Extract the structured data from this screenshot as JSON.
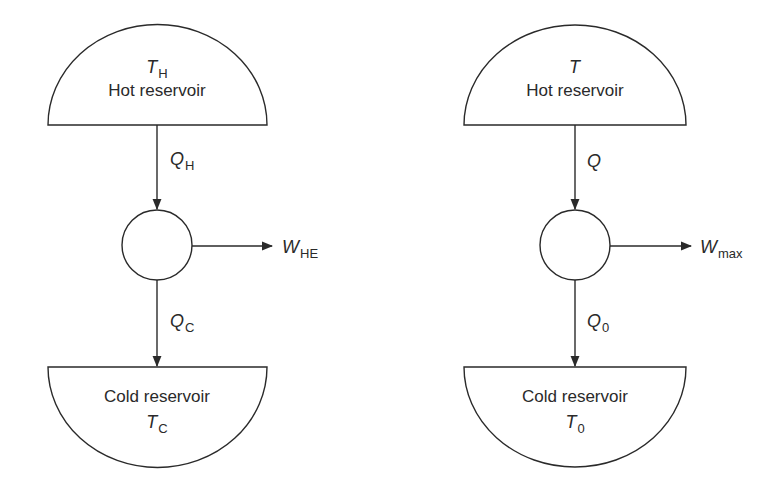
{
  "diagrams": [
    {
      "name": "heat-engine",
      "hot_reservoir": {
        "label": "Hot reservoir",
        "temperature_symbol": "T",
        "temperature_sub": "H"
      },
      "heat_in": {
        "symbol": "Q",
        "sub": "H"
      },
      "work_out": {
        "symbol": "W",
        "sub": "HE"
      },
      "heat_out": {
        "symbol": "Q",
        "sub": "C"
      },
      "cold_reservoir": {
        "label": "Cold reservoir",
        "temperature_symbol": "T",
        "temperature_sub": "C"
      }
    },
    {
      "name": "reversible-engine",
      "hot_reservoir": {
        "label": "Hot reservoir",
        "temperature_symbol": "T",
        "temperature_sub": ""
      },
      "heat_in": {
        "symbol": "Q",
        "sub": ""
      },
      "work_out": {
        "symbol": "W",
        "sub": "max"
      },
      "heat_out": {
        "symbol": "Q",
        "sub": "0"
      },
      "cold_reservoir": {
        "label": "Cold reservoir",
        "temperature_symbol": "T",
        "temperature_sub": "0"
      }
    }
  ],
  "colors": {
    "stroke": "#2a2a2a",
    "background": "#ffffff"
  }
}
